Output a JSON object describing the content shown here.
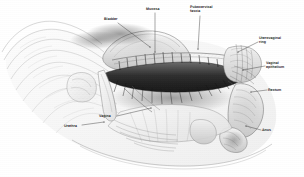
{
  "figure": {
    "style": "grayscale pen-and-ink medical illustration",
    "width": 304,
    "height": 177,
    "background_color": "#ffffff",
    "ink_color": "#2b2b2b",
    "leader_line_color": "#3a3a3a"
  },
  "labels": [
    {
      "id": "bladder",
      "text": "Bladder",
      "x": 104,
      "y": 17,
      "align": "left"
    },
    {
      "id": "mucosa",
      "text": "Mucosa",
      "x": 146,
      "y": 7,
      "align": "left"
    },
    {
      "id": "pubocervical",
      "text": "Pubocervical\nfascia",
      "x": 190,
      "y": 5,
      "align": "left"
    },
    {
      "id": "uterovaginal-ring",
      "text": "Uterovaginal\nring",
      "x": 259,
      "y": 36,
      "align": "left"
    },
    {
      "id": "vaginal-epithelium",
      "text": "Vaginal\nepithelium",
      "x": 266,
      "y": 61,
      "align": "left"
    },
    {
      "id": "rectum",
      "text": "Rectum",
      "x": 268,
      "y": 88,
      "align": "left"
    },
    {
      "id": "anus",
      "text": "Anus",
      "x": 262,
      "y": 128,
      "align": "left"
    },
    {
      "id": "vagina",
      "text": "Vagina",
      "x": 99,
      "y": 114,
      "align": "left"
    },
    {
      "id": "urethra",
      "text": "Urethra",
      "x": 64,
      "y": 124,
      "align": "left"
    }
  ],
  "leaders": [
    {
      "id": "bladder-leader",
      "from": [
        118,
        23
      ],
      "to": [
        150,
        47
      ]
    },
    {
      "id": "mucosa-leader",
      "from": [
        155,
        13
      ],
      "to": [
        155,
        52
      ]
    },
    {
      "id": "pubocervical-leader",
      "from": [
        200,
        16
      ],
      "to": [
        198,
        49
      ]
    },
    {
      "id": "uterovaginal-ring-leader",
      "from": [
        258,
        42
      ],
      "to": [
        238,
        52
      ]
    },
    {
      "id": "vaginal-epithelium-leader",
      "from": [
        265,
        66
      ],
      "to": [
        243,
        70
      ]
    },
    {
      "id": "rectum-leader",
      "from": [
        267,
        90
      ],
      "to": [
        251,
        92
      ]
    },
    {
      "id": "anus-leader",
      "from": [
        261,
        130
      ],
      "to": [
        246,
        126
      ]
    },
    {
      "id": "vagina-leader",
      "from": [
        117,
        116
      ],
      "to": [
        151,
        108
      ]
    },
    {
      "id": "urethra-leader",
      "from": [
        82,
        125
      ],
      "to": [
        104,
        122
      ]
    }
  ],
  "structures": [
    {
      "id": "bladder-dome",
      "label": "Bladder"
    },
    {
      "id": "vaginal-rugae",
      "label": "Mucosa"
    },
    {
      "id": "pubocervical-fascia",
      "label": "Pubocervical fascia"
    },
    {
      "id": "uterovaginal-ring",
      "label": "Uterovaginal ring"
    },
    {
      "id": "vaginal-epithelium",
      "label": "Vaginal epithelium"
    },
    {
      "id": "rectum",
      "label": "Rectum"
    },
    {
      "id": "anus",
      "label": "Anus"
    },
    {
      "id": "vagina",
      "label": "Vagina"
    },
    {
      "id": "urethra",
      "label": "Urethra"
    },
    {
      "id": "pubic-symphysis",
      "label": "Pubic bone"
    },
    {
      "id": "perineal-body",
      "label": "Perineal body"
    }
  ]
}
